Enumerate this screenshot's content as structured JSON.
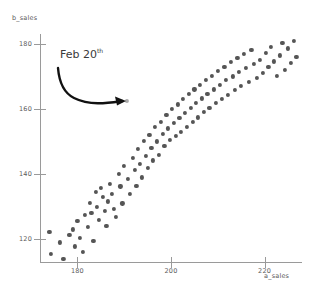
{
  "chart_data": {
    "type": "scatter",
    "title": "",
    "xlabel": "a_sales",
    "ylabel": "b_sales",
    "xlim": [
      172,
      228
    ],
    "ylim": [
      113,
      183
    ],
    "xticks": [
      180,
      200,
      220
    ],
    "yticks": [
      120,
      140,
      160,
      180
    ],
    "grid": false,
    "legend": null,
    "marker_color": "#555555",
    "highlight_color": "#aaaaaa",
    "axis_color": "#9a9a9a",
    "annotations": [
      {
        "text": "Feb 20",
        "superscript": "th",
        "points_to_x": 190.5,
        "points_to_y": 162.5
      }
    ],
    "points": [
      {
        "x": 174.0,
        "y": 122.2
      },
      {
        "x": 174.4,
        "y": 115.4
      },
      {
        "x": 176.2,
        "y": 119.0
      },
      {
        "x": 177.0,
        "y": 114.0
      },
      {
        "x": 178.3,
        "y": 121.3
      },
      {
        "x": 179.0,
        "y": 123.0
      },
      {
        "x": 179.4,
        "y": 117.8
      },
      {
        "x": 180.0,
        "y": 125.6
      },
      {
        "x": 180.6,
        "y": 120.4
      },
      {
        "x": 181.2,
        "y": 116.0
      },
      {
        "x": 181.6,
        "y": 127.4
      },
      {
        "x": 182.2,
        "y": 123.8
      },
      {
        "x": 182.6,
        "y": 131.2
      },
      {
        "x": 183.0,
        "y": 128.0
      },
      {
        "x": 183.4,
        "y": 119.6
      },
      {
        "x": 183.9,
        "y": 134.6
      },
      {
        "x": 184.2,
        "y": 130.0
      },
      {
        "x": 184.6,
        "y": 126.0
      },
      {
        "x": 185.0,
        "y": 135.8
      },
      {
        "x": 185.4,
        "y": 133.0
      },
      {
        "x": 185.8,
        "y": 128.6
      },
      {
        "x": 186.2,
        "y": 124.2
      },
      {
        "x": 186.6,
        "y": 131.6
      },
      {
        "x": 187.0,
        "y": 137.0
      },
      {
        "x": 187.4,
        "y": 133.8
      },
      {
        "x": 187.8,
        "y": 129.2
      },
      {
        "x": 188.2,
        "y": 126.8
      },
      {
        "x": 188.8,
        "y": 140.0
      },
      {
        "x": 189.2,
        "y": 136.2
      },
      {
        "x": 189.6,
        "y": 131.0
      },
      {
        "x": 190.0,
        "y": 142.4
      },
      {
        "x": 190.5,
        "y": 162.5
      },
      {
        "x": 190.8,
        "y": 138.6
      },
      {
        "x": 191.2,
        "y": 134.0
      },
      {
        "x": 191.8,
        "y": 145.0
      },
      {
        "x": 192.2,
        "y": 141.2
      },
      {
        "x": 192.6,
        "y": 136.4
      },
      {
        "x": 193.0,
        "y": 147.8
      },
      {
        "x": 193.4,
        "y": 143.0
      },
      {
        "x": 193.8,
        "y": 139.0
      },
      {
        "x": 194.2,
        "y": 150.2
      },
      {
        "x": 194.6,
        "y": 145.6
      },
      {
        "x": 195.0,
        "y": 141.8
      },
      {
        "x": 195.4,
        "y": 152.0
      },
      {
        "x": 195.8,
        "y": 148.0
      },
      {
        "x": 196.2,
        "y": 144.2
      },
      {
        "x": 196.6,
        "y": 154.4
      },
      {
        "x": 197.0,
        "y": 150.0
      },
      {
        "x": 197.4,
        "y": 146.0
      },
      {
        "x": 197.8,
        "y": 156.0
      },
      {
        "x": 198.2,
        "y": 152.4
      },
      {
        "x": 198.6,
        "y": 148.6
      },
      {
        "x": 199.0,
        "y": 158.2
      },
      {
        "x": 199.4,
        "y": 154.0
      },
      {
        "x": 199.8,
        "y": 150.4
      },
      {
        "x": 200.2,
        "y": 160.0
      },
      {
        "x": 200.6,
        "y": 155.8
      },
      {
        "x": 201.0,
        "y": 151.6
      },
      {
        "x": 201.4,
        "y": 161.4
      },
      {
        "x": 201.8,
        "y": 157.2
      },
      {
        "x": 202.2,
        "y": 153.0
      },
      {
        "x": 202.6,
        "y": 163.0
      },
      {
        "x": 203.0,
        "y": 158.8
      },
      {
        "x": 203.4,
        "y": 154.6
      },
      {
        "x": 203.8,
        "y": 164.6
      },
      {
        "x": 204.2,
        "y": 160.2
      },
      {
        "x": 204.6,
        "y": 156.0
      },
      {
        "x": 205.0,
        "y": 166.0
      },
      {
        "x": 205.4,
        "y": 161.8
      },
      {
        "x": 205.8,
        "y": 157.4
      },
      {
        "x": 206.2,
        "y": 167.4
      },
      {
        "x": 206.6,
        "y": 163.2
      },
      {
        "x": 207.0,
        "y": 159.0
      },
      {
        "x": 207.4,
        "y": 168.8
      },
      {
        "x": 207.8,
        "y": 164.6
      },
      {
        "x": 208.2,
        "y": 160.4
      },
      {
        "x": 208.8,
        "y": 170.2
      },
      {
        "x": 209.2,
        "y": 166.0
      },
      {
        "x": 209.6,
        "y": 161.8
      },
      {
        "x": 210.0,
        "y": 171.6
      },
      {
        "x": 210.4,
        "y": 167.4
      },
      {
        "x": 210.8,
        "y": 163.0
      },
      {
        "x": 211.4,
        "y": 173.0
      },
      {
        "x": 211.8,
        "y": 168.8
      },
      {
        "x": 212.2,
        "y": 164.4
      },
      {
        "x": 212.8,
        "y": 174.4
      },
      {
        "x": 213.2,
        "y": 170.0
      },
      {
        "x": 213.6,
        "y": 165.8
      },
      {
        "x": 214.2,
        "y": 175.6
      },
      {
        "x": 214.6,
        "y": 171.4
      },
      {
        "x": 215.0,
        "y": 167.0
      },
      {
        "x": 215.6,
        "y": 176.8
      },
      {
        "x": 216.0,
        "y": 172.6
      },
      {
        "x": 216.6,
        "y": 168.2
      },
      {
        "x": 217.2,
        "y": 178.0
      },
      {
        "x": 217.8,
        "y": 173.8
      },
      {
        "x": 218.4,
        "y": 169.4
      },
      {
        "x": 219.0,
        "y": 175.0
      },
      {
        "x": 219.6,
        "y": 171.0
      },
      {
        "x": 220.2,
        "y": 177.2
      },
      {
        "x": 220.8,
        "y": 172.8
      },
      {
        "x": 221.4,
        "y": 179.0
      },
      {
        "x": 222.0,
        "y": 174.6
      },
      {
        "x": 222.6,
        "y": 170.2
      },
      {
        "x": 223.2,
        "y": 176.4
      },
      {
        "x": 223.8,
        "y": 180.2
      },
      {
        "x": 224.4,
        "y": 172.0
      },
      {
        "x": 225.0,
        "y": 178.6
      },
      {
        "x": 225.6,
        "y": 174.2
      },
      {
        "x": 226.2,
        "y": 181.0
      },
      {
        "x": 226.8,
        "y": 176.0
      }
    ]
  },
  "caption": ""
}
